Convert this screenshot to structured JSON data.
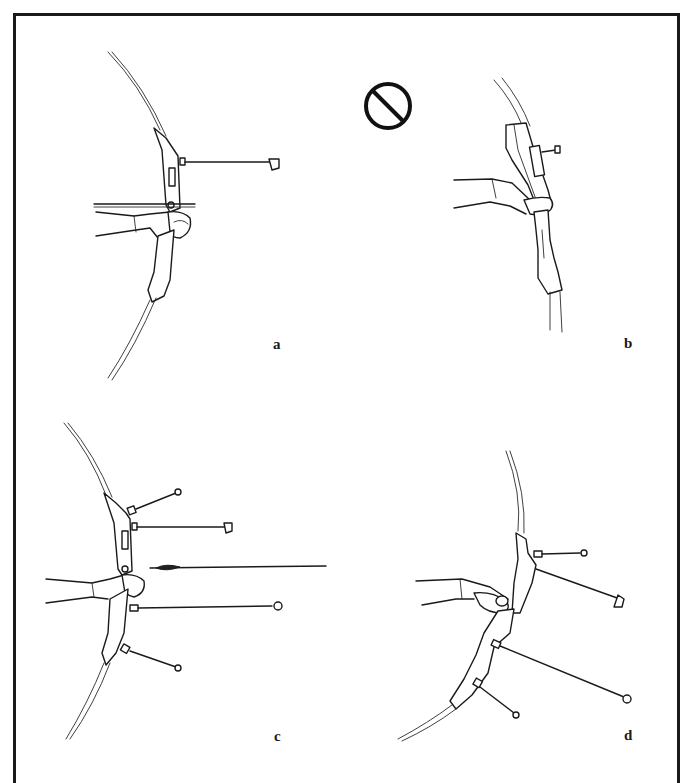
{
  "figure": {
    "frame_color": "#1a1a1a",
    "background": "#ffffff"
  },
  "panels": [
    {
      "id": "a",
      "label": "a",
      "content": "bow arm extended, bow with long stabilizer, arrow at rest",
      "prohibited": false
    },
    {
      "id": "b",
      "label": "b",
      "content": "incorrect grip with short sight extension",
      "prohibited": true
    },
    {
      "id": "c",
      "label": "c",
      "content": "bow with stabilizers, sight and arrow",
      "prohibited": false
    },
    {
      "id": "d",
      "label": "d",
      "content": "canted bow with stabilizers and sight",
      "prohibited": false
    }
  ],
  "icons": {
    "prohibited": "prohibited-icon"
  }
}
